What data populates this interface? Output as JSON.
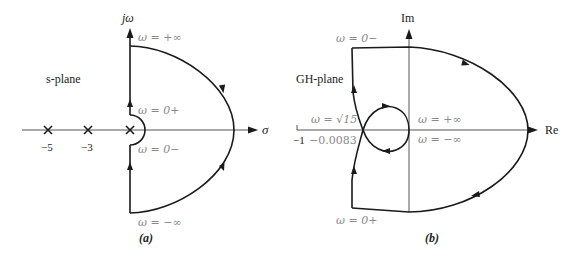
{
  "panel_a": {
    "caption": "(a)",
    "plane_label": "s-plane",
    "axes": {
      "vertical": "jω",
      "horizontal": "σ"
    },
    "labels": {
      "omega_plus_inf": "ω = +∞",
      "omega_0_plus": "ω = 0+",
      "omega_0_minus": "ω = 0−",
      "omega_minus_inf": "ω = −∞"
    },
    "poles": [
      {
        "value": "−5",
        "marker": "×"
      },
      {
        "value": "−3",
        "marker": "×"
      },
      {
        "value": "0",
        "marker": "×"
      }
    ],
    "tick_labels": [
      "−5",
      "−3"
    ]
  },
  "panel_b": {
    "caption": "(b)",
    "plane_label": "GH-plane",
    "axes": {
      "vertical": "Im",
      "horizontal": "Re"
    },
    "labels": {
      "omega_0_minus": "ω = 0−",
      "omega_sqrt15": "ω = √15",
      "omega_plus_inf": "ω = +∞",
      "omega_minus_inf": "ω = −∞",
      "omega_0_plus": "ω = 0+"
    },
    "tick_labels": {
      "minus_one": "−1",
      "crossing": "−0.0083"
    }
  },
  "colors": {
    "curve": "#1a1a1a",
    "axis": "#555555",
    "annotation": "#8a8a8a",
    "background": "#ffffff"
  }
}
